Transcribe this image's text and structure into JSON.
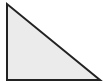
{
  "diagram": {
    "shape": "right-triangle",
    "vertices": [
      [
        7,
        4
      ],
      [
        7,
        80
      ],
      [
        100,
        80
      ]
    ],
    "fill": "#ebebeb",
    "stroke": "#222222",
    "stroke_width": 2
  }
}
